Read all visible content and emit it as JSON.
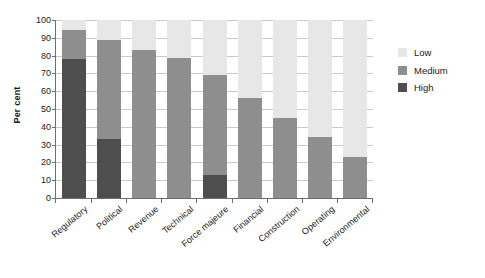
{
  "chart_data": {
    "type": "bar",
    "stacked": true,
    "title": "",
    "subtitle": "",
    "xlabel": "",
    "ylabel": "Per cent",
    "ylim": [
      0,
      100
    ],
    "ytick_step": 10,
    "ytick_labels": [
      "100",
      "90",
      "80",
      "70",
      "60",
      "50",
      "40",
      "30",
      "20",
      "10",
      "0"
    ],
    "grid": true,
    "legend_position": "right",
    "categories": [
      "Regulatory",
      "Political",
      "Revenue",
      "Technical",
      "Force majeure",
      "Financial",
      "Construction",
      "Operating",
      "Environmental"
    ],
    "series": [
      {
        "name": "High",
        "color": "#4e4e4e",
        "values": [
          78,
          33,
          0,
          0,
          13,
          0,
          0,
          0,
          0
        ]
      },
      {
        "name": "Medium",
        "color": "#8e8e8e",
        "values": [
          16.5,
          55.5,
          83,
          78.5,
          56,
          56,
          45,
          34,
          23
        ]
      },
      {
        "name": "Low",
        "color": "#e7e7e7",
        "values": [
          5.5,
          11.5,
          17,
          21.5,
          31,
          44,
          55,
          66,
          77
        ]
      }
    ],
    "cumulative_tops": {
      "high": [
        78,
        33,
        0,
        0,
        13,
        0,
        0,
        0,
        0
      ],
      "medium": [
        94.5,
        88.5,
        83,
        78.5,
        69,
        56,
        45,
        34,
        23
      ],
      "low": [
        100,
        100,
        100,
        100,
        100,
        100,
        100,
        100,
        100
      ]
    }
  },
  "legend": {
    "items": [
      {
        "label": "Low",
        "color": "#e7e7e7"
      },
      {
        "label": "Medium",
        "color": "#8e8e8e"
      },
      {
        "label": "High",
        "color": "#4e4e4e"
      }
    ]
  },
  "colors": {
    "axis": "#6f6f6f",
    "grid": "#c9c9c9",
    "text": "#1a1a1a",
    "background": "#ffffff"
  }
}
